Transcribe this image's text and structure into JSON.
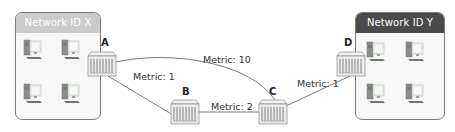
{
  "networks": [
    {
      "id": "x",
      "title": "Network ID X",
      "header_color": "#c8c8c8",
      "computers": 4
    },
    {
      "id": "y",
      "title": "Network ID Y",
      "header_color": "#4a4a4a",
      "computers": 4
    }
  ],
  "routers": [
    {
      "id": "A",
      "label": "A"
    },
    {
      "id": "B",
      "label": "B"
    },
    {
      "id": "C",
      "label": "C"
    },
    {
      "id": "D",
      "label": "D"
    }
  ],
  "links": [
    {
      "from": "A",
      "to": "C",
      "label": "Metric: 10"
    },
    {
      "from": "A",
      "to": "B",
      "label": "Metric: 1"
    },
    {
      "from": "B",
      "to": "C",
      "label": "Metric: 2"
    },
    {
      "from": "C",
      "to": "D",
      "label": "Metric: 1"
    }
  ],
  "colors": {
    "line": "#6a6a6a",
    "router_fill": "#e8e8e8",
    "box_border": "#7a7a7a"
  }
}
